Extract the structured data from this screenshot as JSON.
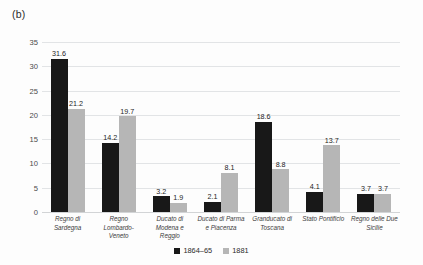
{
  "panel": {
    "label": "(b)"
  },
  "legend": {
    "position": "bottom-center",
    "entries": [
      {
        "name": "series-1864-65",
        "label": "1864–65",
        "color": "#181818"
      },
      {
        "name": "series-1881",
        "label": "1881",
        "color": "#b6b6b6"
      }
    ]
  },
  "axis": {
    "y_ticks": [
      "0",
      "5",
      "10",
      "15",
      "20",
      "25",
      "30",
      "35"
    ]
  },
  "chart_data": {
    "type": "bar",
    "title": "",
    "subtitle": "",
    "xlabel": "",
    "ylabel": "",
    "ylim": [
      0,
      35
    ],
    "ytick_step": 5,
    "grid": true,
    "legend_position": "bottom-center",
    "categories": [
      "Regno di Sardegna",
      "Regno Lombardo-Veneto",
      "Ducato di Modena e Reggio",
      "Ducato di Parma e Piacenza",
      "Granducato di Toscana",
      "Stato Pontificio",
      "Regno delle Due Sicilie"
    ],
    "series": [
      {
        "name": "1864–65",
        "color": "#181818",
        "values": [
          31.6,
          14.2,
          3.2,
          2.1,
          18.6,
          4.1,
          3.7
        ],
        "labels": [
          "31.6",
          "14.2",
          "3.2",
          "2.1",
          "18.6",
          "4.1",
          "3.7"
        ]
      },
      {
        "name": "1881",
        "color": "#b6b6b6",
        "values": [
          21.2,
          19.7,
          1.9,
          8.1,
          8.8,
          13.7,
          3.7
        ],
        "labels": [
          "21.2",
          "19.7",
          "1.9",
          "8.1",
          "8.8",
          "13.7",
          "3.7"
        ]
      }
    ]
  }
}
